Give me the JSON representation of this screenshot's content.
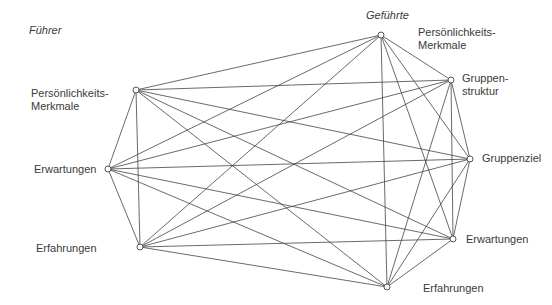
{
  "groups": {
    "left": {
      "title": "Führer"
    },
    "right": {
      "title": "Geführte"
    }
  },
  "nodes": [
    {
      "id": "L1",
      "label": "Persönlichkeits-\nMerkmale",
      "x": 136,
      "y": 90
    },
    {
      "id": "L2",
      "label": "Erwartungen",
      "x": 108,
      "y": 169
    },
    {
      "id": "L3",
      "label": "Erfahrungen",
      "x": 140,
      "y": 247
    },
    {
      "id": "R1",
      "label": "Persönlichkeits-\nMerkmale",
      "x": 381,
      "y": 35
    },
    {
      "id": "R2",
      "label": "Gruppen-\nstruktur",
      "x": 451,
      "y": 80
    },
    {
      "id": "R3",
      "label": "Gruppenziel",
      "x": 470,
      "y": 159
    },
    {
      "id": "R4",
      "label": "Erwartungen",
      "x": 453,
      "y": 239
    },
    {
      "id": "R5",
      "label": "Erfahrungen",
      "x": 387,
      "y": 287
    }
  ],
  "edges": [
    [
      "L1",
      "L2"
    ],
    [
      "L2",
      "L3"
    ],
    [
      "L1",
      "L3"
    ],
    [
      "L1",
      "R1"
    ],
    [
      "L1",
      "R2"
    ],
    [
      "L1",
      "R3"
    ],
    [
      "L1",
      "R4"
    ],
    [
      "L1",
      "R5"
    ],
    [
      "L2",
      "R1"
    ],
    [
      "L2",
      "R2"
    ],
    [
      "L2",
      "R3"
    ],
    [
      "L2",
      "R4"
    ],
    [
      "L2",
      "R5"
    ],
    [
      "L3",
      "R1"
    ],
    [
      "L3",
      "R2"
    ],
    [
      "L3",
      "R3"
    ],
    [
      "L3",
      "R4"
    ],
    [
      "L3",
      "R5"
    ],
    [
      "R1",
      "R2"
    ],
    [
      "R2",
      "R3"
    ],
    [
      "R3",
      "R4"
    ],
    [
      "R4",
      "R5"
    ],
    [
      "R1",
      "R3"
    ],
    [
      "R1",
      "R4"
    ],
    [
      "R1",
      "R5"
    ],
    [
      "R2",
      "R4"
    ],
    [
      "R2",
      "R5"
    ],
    [
      "R3",
      "R5"
    ]
  ],
  "style": {
    "line_color": "#444444",
    "node_fill": "#ffffff"
  }
}
